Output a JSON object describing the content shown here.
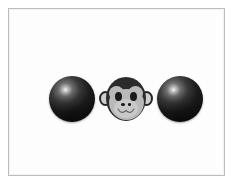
{
  "image": {
    "title": "Three objects on white background",
    "background_color": "#ffffff",
    "frame": {
      "name": "picture-frame",
      "border_color": "#bdbdbd",
      "inner_background": "#fdfdfd"
    }
  },
  "scene": {
    "description": "Two dark glossy spheres flanking a cartoon monkey face",
    "object_count": 3,
    "objects": [
      {
        "id": "sphere-left",
        "label": "black sphere",
        "kind": "sphere",
        "color": "#121212",
        "highlight_color": "#f6f6f6",
        "x": 40,
        "y": 67,
        "diameter": 46
      },
      {
        "id": "monkey",
        "label": "monkey face",
        "kind": "monkey-face",
        "head_color": "#2b2b2b",
        "face_color": "#b9b9b9",
        "ear_color": "#cfcfcf",
        "eye_color": "#1a1a1a",
        "x": 90,
        "y": 66,
        "width": 54,
        "height": 48
      },
      {
        "id": "sphere-right",
        "label": "black sphere",
        "kind": "sphere",
        "color": "#121212",
        "highlight_color": "#f6f6f6",
        "x": 148,
        "y": 67,
        "diameter": 46
      }
    ]
  },
  "monkey_parts": {
    "ear_left": "left ear",
    "ear_right": "right ear",
    "head": "dark head cap",
    "face": "light face",
    "eye_left": "left eye",
    "eye_right": "right eye",
    "nostril_left": "left nostril",
    "nostril_right": "right nostril",
    "mouth": "smiling mouth"
  }
}
